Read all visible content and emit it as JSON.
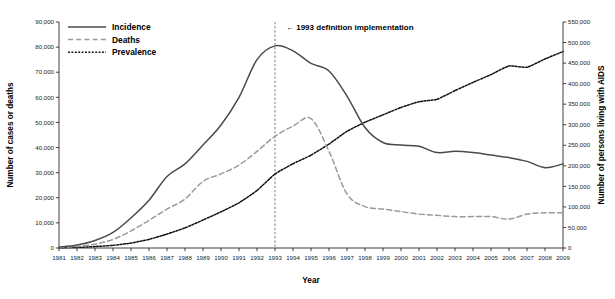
{
  "chart_data": {
    "type": "line",
    "title": "",
    "xlabel": "Year",
    "ylabel": "Number of cases or deaths",
    "ylabel_right": "Number of persons living with AIDS",
    "grid": false,
    "legend_position": "top-left",
    "xlim": [
      1981,
      2009
    ],
    "ylim": [
      0,
      90000
    ],
    "ylim_right": [
      0,
      550000
    ],
    "categories": [
      1981,
      1982,
      1983,
      1984,
      1985,
      1986,
      1987,
      1988,
      1989,
      1990,
      1991,
      1992,
      1993,
      1994,
      1995,
      1996,
      1997,
      1998,
      1999,
      2000,
      2001,
      2002,
      2003,
      2004,
      2005,
      2006,
      2007,
      2008,
      2009
    ],
    "x_tick_labels": [
      "1981",
      "1982",
      "1983",
      "1984",
      "1985",
      "1986",
      "1987",
      "1988",
      "1989",
      "1990",
      "1991",
      "1992",
      "1993",
      "1994",
      "1995",
      "1996",
      "1997",
      "1998",
      "1999",
      "2000",
      "2001",
      "2002",
      "2003",
      "2004",
      "2005",
      "2006",
      "2007",
      "2008",
      "2009"
    ],
    "y_tick_labels": [
      "0",
      "10,000",
      "20,000",
      "30,000",
      "40,000",
      "50,000",
      "60,000",
      "70,000",
      "80,000",
      "90,000"
    ],
    "y_ticks": [
      0,
      10000,
      20000,
      30000,
      40000,
      50000,
      60000,
      70000,
      80000,
      90000
    ],
    "y_tick_labels_right": [
      "0",
      "50,000",
      "100,000",
      "150,000",
      "200,000",
      "250,000",
      "300,000",
      "350,000",
      "400,000",
      "450,000",
      "500,000",
      "550,000"
    ],
    "y_ticks_right": [
      0,
      50000,
      100000,
      150000,
      200000,
      250000,
      300000,
      350000,
      400000,
      450000,
      500000,
      550000
    ],
    "series": [
      {
        "name": "Incidence",
        "axis": "left",
        "style": "solid",
        "color": "#4a4a4a",
        "values": [
          300,
          1200,
          3000,
          6200,
          12000,
          19000,
          28500,
          33500,
          41000,
          49000,
          60000,
          75000,
          80500,
          78500,
          73500,
          70500,
          60500,
          48000,
          42000,
          41000,
          40500,
          38000,
          38500,
          38000,
          37000,
          36000,
          34500,
          32000,
          33500
        ]
      },
      {
        "name": "Deaths",
        "axis": "left",
        "style": "dashed",
        "color": "#9a9a9a",
        "values": [
          150,
          600,
          1500,
          3400,
          6800,
          11000,
          15500,
          19500,
          26500,
          29500,
          33000,
          38500,
          44500,
          48500,
          51500,
          38500,
          21500,
          16500,
          15500,
          14500,
          13500,
          13000,
          12500,
          12500,
          12500,
          11500,
          13500,
          14000,
          14000
        ]
      },
      {
        "name": "Prevalence",
        "axis": "right",
        "style": "dotted",
        "color": "#111111",
        "values": [
          500,
          1500,
          3500,
          6500,
          12000,
          21000,
          34000,
          49000,
          68000,
          88000,
          110000,
          140000,
          180000,
          205000,
          226000,
          253000,
          284000,
          306000,
          324000,
          342000,
          356000,
          362000,
          383000,
          403000,
          422000,
          443000,
          440000,
          460000,
          478000
        ]
      }
    ],
    "annotations": [
      {
        "name": "1993-definition-line",
        "x": 1993,
        "label": "← 1993 definition implementation"
      }
    ]
  },
  "legend": {
    "items": [
      {
        "label": "Incidence",
        "style": "solid"
      },
      {
        "label": "Deaths",
        "style": "dashed"
      },
      {
        "label": "Prevalence",
        "style": "dotted"
      }
    ]
  }
}
